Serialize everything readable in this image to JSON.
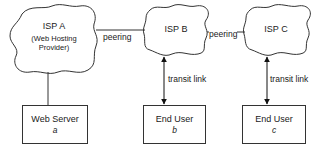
{
  "nodes": {
    "isp_a": {
      "title": "ISP A",
      "subtitle_line1": "(Web Hosting",
      "subtitle_line2": "Provider)"
    },
    "isp_b": {
      "title": "ISP B"
    },
    "isp_c": {
      "title": "ISP C"
    },
    "web_server": {
      "name": "Web Server",
      "id": "a"
    },
    "end_user_b": {
      "name": "End User",
      "id": "b"
    },
    "end_user_c": {
      "name": "End User",
      "id": "c"
    }
  },
  "edges": {
    "peering_ab": {
      "label": "peering"
    },
    "peering_bc": {
      "label": "peering"
    },
    "transit_b": {
      "label": "transit link"
    },
    "transit_c": {
      "label": "transit link"
    }
  },
  "colors": {
    "stroke": "#333333",
    "text": "#1a1a1a",
    "background": "#ffffff"
  }
}
